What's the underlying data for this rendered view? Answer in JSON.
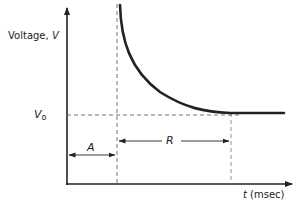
{
  "diagram": {
    "title": "",
    "y_axis_label": "Voltage,",
    "y_axis_symbol": "V",
    "x_axis_label_symbol": "t",
    "x_axis_label_unit": "(msec)",
    "baseline_label_symbol": "V",
    "baseline_label_subscript": "o",
    "interval_a_label": "A",
    "interval_r_label": "R",
    "colors": {
      "line": "#222222",
      "dashed": "#666666",
      "background": "#ffffff"
    }
  }
}
